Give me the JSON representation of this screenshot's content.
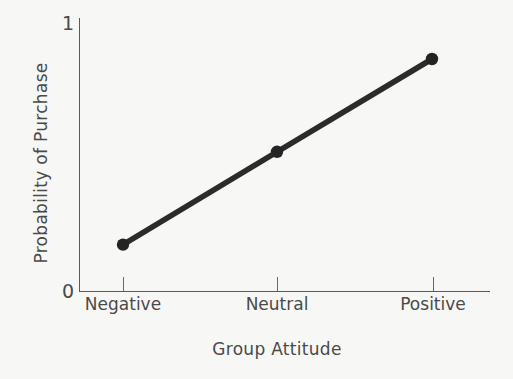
{
  "chart_data": {
    "type": "line",
    "title": "",
    "subtitle": "",
    "xlabel": "Group Attitude",
    "ylabel": "Probability of Purchase",
    "categories": [
      "Negative",
      "Neutral",
      "Positive"
    ],
    "series": [
      {
        "name": "Probability of Purchase",
        "values": [
          0.17,
          0.51,
          0.85
        ]
      }
    ],
    "ylim": [
      0,
      1
    ],
    "y_tick_labels": [
      "0",
      "1"
    ],
    "y_tick_values": [
      0,
      1
    ],
    "x_tick_labels": [
      "Negative",
      "Neutral",
      "Positive"
    ],
    "grid": false,
    "legend": false,
    "legend_position": "none",
    "annotations": [],
    "marker": "filled-circle",
    "line_color": "#2b2b2b",
    "marker_color": "#242424",
    "axis_color": "#5a5a5a",
    "background_color": "#f7f7f5"
  },
  "axes": {
    "y_max_label": "1",
    "y_min_label": "0",
    "y_axis_title": "Probability of Purchase",
    "x_axis_title": "Group Attitude"
  },
  "ticks": {
    "x": [
      "Negative",
      "Neutral",
      "Positive"
    ]
  }
}
